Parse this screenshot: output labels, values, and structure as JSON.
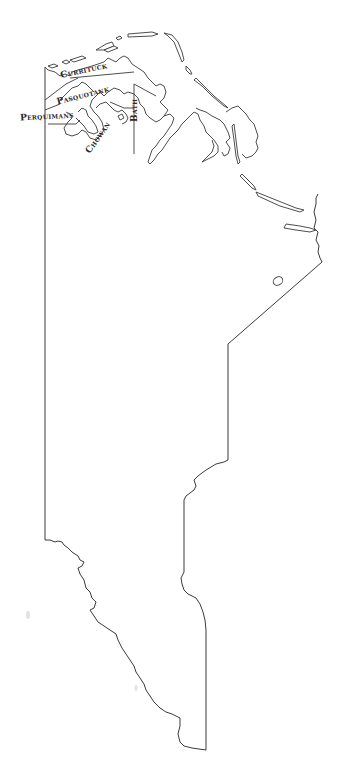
{
  "map": {
    "title": "",
    "labels": [
      {
        "id": "currituck",
        "text": "Currituck"
      },
      {
        "id": "pasquotank",
        "text": "Pasquotank"
      },
      {
        "id": "perquimans",
        "text": "Perquimans"
      },
      {
        "id": "chowan",
        "text": "Chowan"
      },
      {
        "id": "bath",
        "text": "Bath"
      }
    ],
    "colors": {
      "line": "#3a3a3a",
      "background": "#ffffff",
      "text": "#2a2a2a"
    }
  }
}
